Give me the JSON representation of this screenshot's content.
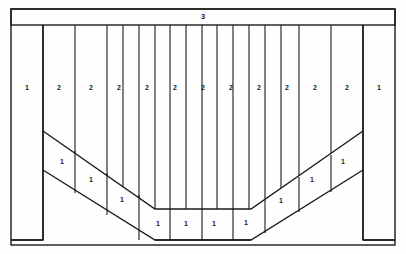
{
  "diagram": {
    "colors": {
      "line": "#1b1b1b",
      "background": "#fefefe",
      "label": "#1b1b1b"
    },
    "frame": {
      "name": "outer-border",
      "x": 11,
      "y": 9,
      "width": 384,
      "height": 236
    },
    "top_beam": {
      "name": "top-beam",
      "x": 11,
      "y": 9,
      "width": 384,
      "height": 16,
      "label": "3",
      "label_x": 203,
      "label_y": 17
    },
    "legs": [
      {
        "name": "left-leg",
        "x": 11,
        "y": 25,
        "width": 32,
        "height": 215
      },
      {
        "name": "right-leg",
        "x": 363,
        "y": 25,
        "width": 32,
        "height": 215
      }
    ],
    "column_lines_x": [
      11,
      43,
      75,
      107,
      123,
      139,
      155,
      170,
      186,
      202,
      217,
      233,
      249,
      265,
      281,
      299,
      331,
      363,
      395
    ],
    "upper_columns": [
      {
        "label": "1",
        "x": 27,
        "y": 88
      },
      {
        "label": "2",
        "x": 59,
        "y": 88
      },
      {
        "label": "2",
        "x": 91,
        "y": 88
      },
      {
        "label": "2",
        "x": 119,
        "y": 88
      },
      {
        "label": "2",
        "x": 147,
        "y": 88
      },
      {
        "label": "2",
        "x": 175,
        "y": 88
      },
      {
        "label": "2",
        "x": 203,
        "y": 88
      },
      {
        "label": "2",
        "x": 231,
        "y": 88
      },
      {
        "label": "2",
        "x": 259,
        "y": 88
      },
      {
        "label": "2",
        "x": 287,
        "y": 88
      },
      {
        "label": "2",
        "x": 315,
        "y": 88
      },
      {
        "label": "2",
        "x": 347,
        "y": 88
      },
      {
        "label": "1",
        "x": 379,
        "y": 88
      }
    ],
    "band": {
      "name": "v-shaped-band",
      "outer_path": "M 43 131 L 155 209 L 251 209 L 363 131",
      "inner_path": "M 43 170 L 155 240 L 251 240 L 363 170",
      "left_cap": "M 43 131 L 43 170",
      "right_cap": "M 363 131 L 363 170"
    },
    "band_labels": [
      {
        "label": "1",
        "x": 62,
        "y": 162
      },
      {
        "label": "1",
        "x": 91,
        "y": 180
      },
      {
        "label": "1",
        "x": 122,
        "y": 200
      },
      {
        "label": "1",
        "x": 158,
        "y": 224
      },
      {
        "label": "1",
        "x": 186,
        "y": 224
      },
      {
        "label": "1",
        "x": 214,
        "y": 224
      },
      {
        "label": "1",
        "x": 246,
        "y": 223
      },
      {
        "label": "1",
        "x": 281,
        "y": 201
      },
      {
        "label": "1",
        "x": 312,
        "y": 180
      },
      {
        "label": "1",
        "x": 343,
        "y": 162
      }
    ],
    "band_dividers": [
      "M 75 151 L 75 193",
      "M 107 173 L 107 215",
      "M 139 195 L 139 240",
      "M 170 209 L 170 240",
      "M 202 209 L 202 240",
      "M 233 209 L 233 240",
      "M 265 200 L 265 233",
      "M 299 177 L 299 212",
      "M 331 155 L 331 192"
    ],
    "bottom_closures": [
      "M 11 240 L 43 240",
      "M 363 240 L 395 240",
      "M 155 240 L 251 240"
    ]
  }
}
